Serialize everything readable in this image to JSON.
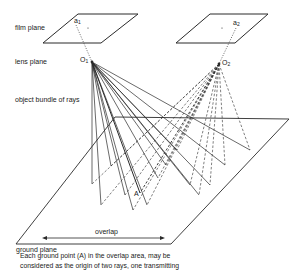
{
  "labels": {
    "film_plane": "film plane",
    "lens_plane": "lens plane",
    "object_bundle": "object bundle of rays",
    "ground_plane": "ground plane",
    "overlap": "overlap"
  },
  "points": {
    "a1": {
      "main": "a",
      "sub": "1"
    },
    "a2": {
      "main": "a",
      "sub": "2"
    },
    "o1": {
      "main": "O",
      "sub": "1"
    },
    "o2": {
      "main": "O",
      "sub": "2"
    },
    "A": "A"
  },
  "caption": {
    "line1": "Each ground point (A) in the overlap area, may be",
    "line2": "considered as the origin of two rays, one transmitting"
  },
  "geometry": {
    "film_plane_1": [
      [
        43,
        43
      ],
      [
        78,
        14
      ],
      [
        138,
        14
      ],
      [
        101,
        43
      ]
    ],
    "film_plane_2": [
      [
        176,
        43
      ],
      [
        210,
        14
      ],
      [
        268,
        14
      ],
      [
        235,
        43
      ]
    ],
    "a1": [
      76,
      25
    ],
    "a2": [
      236,
      28
    ],
    "o1": [
      92,
      62
    ],
    "o2": [
      219,
      64
    ],
    "ground_plane": [
      [
        16,
        244
      ],
      [
        115,
        117
      ],
      [
        289,
        119
      ],
      [
        171,
        244
      ]
    ],
    "overlap_arrow": [
      [
        42,
        238
      ],
      [
        165,
        238
      ]
    ],
    "ground_points": [
      [
        92,
        184
      ],
      [
        101,
        205
      ],
      [
        111,
        166
      ],
      [
        125,
        195
      ],
      [
        133,
        210
      ],
      [
        140,
        193
      ],
      [
        147,
        205
      ],
      [
        158,
        178
      ],
      [
        166,
        165
      ],
      [
        177,
        150
      ],
      [
        190,
        185
      ],
      [
        199,
        195
      ],
      [
        210,
        185
      ],
      [
        225,
        165
      ],
      [
        250,
        150
      ]
    ],
    "highlight_index": 5
  },
  "colors": {
    "line": "#2a2a2a",
    "background": "#ffffff"
  }
}
